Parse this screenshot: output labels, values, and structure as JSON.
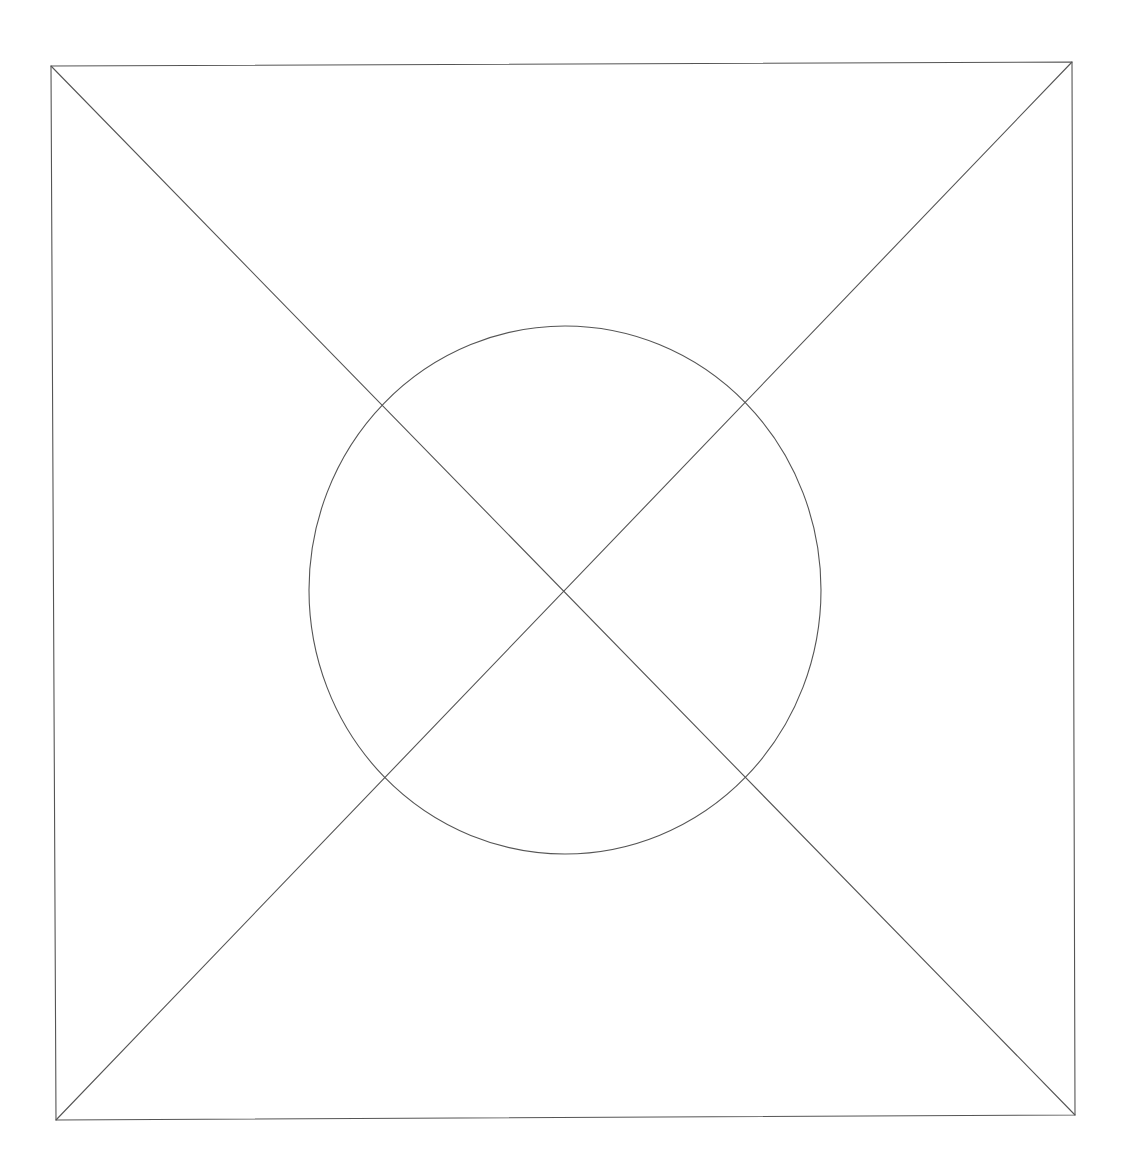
{
  "diagram": {
    "type": "image-placeholder-wireframe",
    "stroke_color": "#555555",
    "background_color": "#ffffff",
    "frame": {
      "top_left": [
        51,
        66
      ],
      "top_right": [
        1072,
        62
      ],
      "bottom_right": [
        1075,
        1115
      ],
      "bottom_left": [
        56,
        1120
      ]
    },
    "diagonals": [
      {
        "from": [
          51,
          66
        ],
        "to": [
          1075,
          1115
        ]
      },
      {
        "from": [
          1072,
          62
        ],
        "to": [
          56,
          1120
        ]
      }
    ],
    "circle": {
      "cx": 565,
      "cy": 590,
      "rx": 256,
      "ry": 264
    }
  }
}
